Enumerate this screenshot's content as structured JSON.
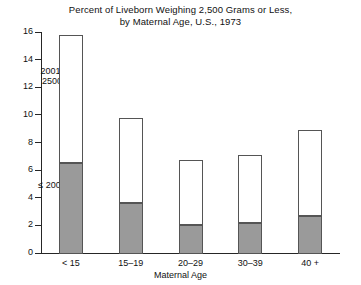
{
  "chart_data": {
    "type": "bar",
    "title": "Percent of Liveborn Weighing 2,500 Grams or Less, by Maternal Age, U.S., 1973",
    "title_lines": [
      "Percent of Liveborn Weighing 2,500 Grams or Less,",
      "by Maternal Age, U.S., 1973"
    ],
    "xlabel": "Maternal Age",
    "ylabel": "",
    "ylim": [
      0,
      16
    ],
    "ytick_values": [
      0,
      2,
      4,
      6,
      8,
      10,
      12,
      14,
      16
    ],
    "ytick_labels": [
      "0",
      "2",
      "4",
      "6",
      "8",
      "10",
      "12",
      "14",
      "16"
    ],
    "grid": false,
    "legend_position": "in-plot-annotations",
    "stacked": true,
    "categories": [
      "< 15",
      "15–19",
      "20–29",
      "30–39",
      "40 +"
    ],
    "series": [
      {
        "name": "≤ 2000",
        "annotation": "≤ 2000",
        "color": "#9a9a9a",
        "values": [
          6.5,
          3.6,
          2.0,
          2.2,
          2.7
        ]
      },
      {
        "name": "2001–2500",
        "annotation_lines": [
          "2001-",
          "2500"
        ],
        "color": "#ffffff",
        "values": [
          9.3,
          6.2,
          4.7,
          4.9,
          6.2
        ]
      }
    ],
    "totals": [
      15.8,
      9.8,
      6.7,
      7.1,
      8.9
    ],
    "annotations": [
      {
        "text_lines": [
          "2001-",
          "2500"
        ],
        "refers_to": "2001–2500"
      },
      {
        "text_lines": [
          "≤ 2000"
        ],
        "refers_to": "≤ 2000"
      }
    ]
  },
  "colors": {
    "axis": "#262626",
    "bar_outline": "#555555",
    "segment_low": "#9a9a9a",
    "segment_high": "#ffffff",
    "text": "#111111",
    "background": "#ffffff"
  }
}
